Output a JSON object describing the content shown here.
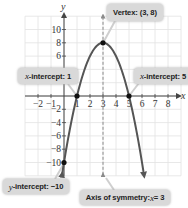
{
  "chart_data": {
    "type": "line",
    "title": "",
    "function": "y = -2(x - 3)^2 + 8",
    "xlabel": "x",
    "ylabel": "y",
    "xlim": [
      -3,
      9
    ],
    "ylim": [
      -12,
      12
    ],
    "grid": true,
    "x_tick_labels": [
      -2,
      -1,
      1,
      2,
      3,
      4,
      5,
      6,
      7,
      8
    ],
    "y_tick_labels": [
      10,
      8,
      6,
      -2,
      -4,
      -6,
      -8,
      -10
    ],
    "y_tick_marks": [
      10,
      8,
      6,
      4,
      2,
      -2,
      -4,
      -6,
      -8,
      -10
    ],
    "curve": {
      "a": -2,
      "h": 3,
      "k": 8,
      "x_range": [
        -0.15,
        6.15
      ]
    },
    "points": [
      {
        "name": "vertex",
        "x": 3,
        "y": 8
      },
      {
        "name": "x-intercept-1",
        "x": 1,
        "y": 0
      },
      {
        "name": "x-intercept-5",
        "x": 5,
        "y": 0
      },
      {
        "name": "y-intercept",
        "x": 0,
        "y": -10
      }
    ],
    "axis_of_symmetry": 3,
    "annotations": [
      {
        "id": "vertex",
        "text": "Vertex: (3, 8)"
      },
      {
        "id": "xint1",
        "var": "x",
        "text": "-intercept: 1"
      },
      {
        "id": "xint5",
        "var": "x",
        "text": "-intercept: 5"
      },
      {
        "id": "yint",
        "var": "y",
        "text": "-intercept: −10"
      },
      {
        "id": "axis",
        "prefix": "Axis of symmetry: ",
        "var": "x",
        "text": " = 3"
      }
    ],
    "colors": {
      "curve": "#555555",
      "grid": "#e2e2e2",
      "axis": "#444444",
      "dashed": "#8a8a8a",
      "callout": "#d9d9d9",
      "pointer": "#cfcfcf",
      "point": "#111111"
    }
  }
}
